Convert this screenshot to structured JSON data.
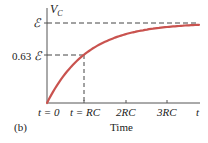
{
  "chart_data": {
    "type": "line",
    "title": "",
    "panel_label": "(b)",
    "xlabel": "Time",
    "ylabel": "V_C",
    "x_tick_labels": [
      "t = 0",
      "t = RC",
      "2RC",
      "3RC",
      "t"
    ],
    "y_tick_labels": [
      "ℰ",
      "0.63 ℰ"
    ],
    "series": [
      {
        "name": "V_C = ℰ(1 - e^(-t/RC))",
        "color": "#c9534f",
        "x_in_RC": [
          0,
          0.5,
          1,
          1.5,
          2,
          2.5,
          3,
          3.5,
          3.8
        ],
        "y_fraction_of_emf": [
          0,
          0.39,
          0.63,
          0.78,
          0.86,
          0.92,
          0.95,
          0.97,
          0.98
        ]
      }
    ],
    "annotations": [
      {
        "type": "dashed-hline",
        "y": "ℰ"
      },
      {
        "type": "dashed-hline",
        "y": "0.63 ℰ",
        "x_end": "RC"
      },
      {
        "type": "dashed-vline",
        "x": "RC",
        "y_end": "0.63 ℰ"
      }
    ],
    "grid": false
  },
  "labels": {
    "vc": "V",
    "vc_sub": "C",
    "emf": "ℰ",
    "emf063_num": "0.63",
    "emf063_sym": "ℰ",
    "t0": "t = 0",
    "trc": "t = RC",
    "rc2": "2RC",
    "rc3": "3RC",
    "t": "t",
    "xlabel": "Time",
    "panel": "(b)"
  }
}
